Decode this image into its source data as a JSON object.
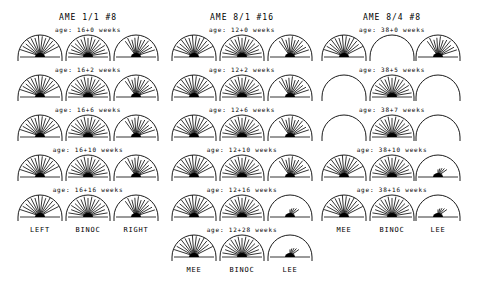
{
  "chart_data": {
    "type": "polar",
    "groups": [
      {
        "title": "AME 1/1 #8",
        "column_labels": [
          "LEFT",
          "BINOC",
          "RIGHT"
        ],
        "rows": [
          {
            "age": "age: 16+0 weeks"
          },
          {
            "age": "age: 16+2 weeks"
          },
          {
            "age": "age: 16+6 weeks"
          },
          {
            "age": "age: 16+10 weeks"
          },
          {
            "age": "age: 16+16 weeks"
          }
        ]
      },
      {
        "title": "AME 8/1 #16",
        "column_labels": [
          "MEE",
          "BINOC",
          "LEE"
        ],
        "rows": [
          {
            "age": "age: 12+0 weeks"
          },
          {
            "age": "age: 12+2 weeks"
          },
          {
            "age": "age: 12+6 weeks"
          },
          {
            "age": "age: 12+10 weeks"
          },
          {
            "age": "age: 12+16 weeks"
          },
          {
            "age": "age: 12+28 weeks"
          }
        ]
      },
      {
        "title": "AME 8/4 #8",
        "column_labels": [
          "MEE",
          "BINOC",
          "LEE"
        ],
        "rows": [
          {
            "age": "age: 38+0 weeks"
          },
          {
            "age": "age: 38+5 weeks"
          },
          {
            "age": "age: 38+7 weeks"
          },
          {
            "age": "age: 38+10 weeks"
          },
          {
            "age": "age: 38+16 weeks"
          }
        ]
      }
    ]
  },
  "page": {
    "groups": [
      {
        "title": "AME 1/1 #8",
        "labels": [
          "LEFT",
          "BINOC",
          "RIGHT"
        ],
        "ages": [
          "age: 16+0 weeks",
          "age: 16+2 weeks",
          "age: 16+6 weeks",
          "age: 16+10 weeks",
          "age: 16+16 weeks"
        ]
      },
      {
        "title": "AME 8/1 #16",
        "labels": [
          "MEE",
          "BINOC",
          "LEE"
        ],
        "ages": [
          "age: 12+0 weeks",
          "age: 12+2 weeks",
          "age: 12+6 weeks",
          "age: 12+10 weeks",
          "age: 12+16 weeks",
          "age: 12+28 weeks"
        ]
      },
      {
        "title": "AME 8/4 #8",
        "labels": [
          "MEE",
          "BINOC",
          "LEE"
        ],
        "ages": [
          "age: 38+0 weeks",
          "age: 38+5 weeks",
          "age: 38+7 weeks",
          "age: 38+10 weeks",
          "age: 38+16 weeks"
        ]
      }
    ]
  }
}
